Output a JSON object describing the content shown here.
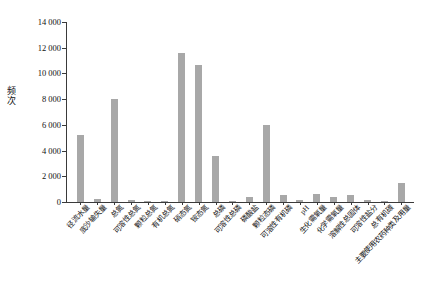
{
  "chart_data": {
    "type": "bar",
    "title": "",
    "xlabel": "",
    "ylabel": "频次",
    "ylim": [
      0,
      14000
    ],
    "ytick_labels": [
      "14 000",
      "12 000",
      "10 000",
      "8 000",
      "6 000",
      "4 000",
      "2 000",
      "0"
    ],
    "ytick_values": [
      14000,
      12000,
      10000,
      8000,
      6000,
      4000,
      2000,
      0
    ],
    "grid": false,
    "legend": null,
    "bar_color": "#a8a8a8",
    "categories": [
      "径流水量",
      "底沙输失量",
      "总氮",
      "可溶性总氮",
      "颗粒总氮",
      "有机总氮",
      "硝态氮",
      "铵态氮",
      "总磷",
      "可溶性总磷",
      "磷酸盐",
      "颗粒态磷",
      "可溶性有机磷",
      "pH",
      "生化需氧量",
      "化学需氧量",
      "溶解性总固体",
      "可溶性盐分",
      "总有机碳",
      "主要使用农药种类及用量"
    ],
    "values": [
      5200,
      210,
      8050,
      120,
      110,
      100,
      11600,
      10650,
      3600,
      60,
      420,
      6000,
      520,
      170,
      600,
      380,
      560,
      120,
      60,
      1500
    ]
  },
  "caption": ""
}
